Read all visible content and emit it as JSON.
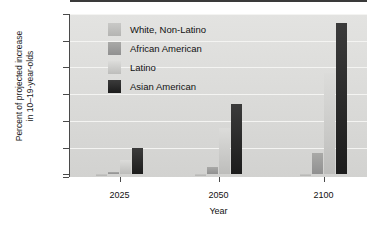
{
  "chart_data": {
    "type": "bar",
    "title": "",
    "xlabel": "Year",
    "ylabel": "Percent of projected increase\nin 10–19-year-olds",
    "categories": [
      "2025",
      "2050",
      "2100"
    ],
    "ylim": [
      -10,
      600
    ],
    "yticks": [
      600,
      500,
      400,
      300,
      200,
      100,
      0,
      -10
    ],
    "grid": true,
    "legend_position": "top-center",
    "series": [
      {
        "name": "White, Non-Latino",
        "color": "#c0c0be",
        "values": [
          -8,
          -6,
          -7
        ]
      },
      {
        "name": "African American",
        "color": "#9d9d9b",
        "values": [
          10,
          28,
          78
        ]
      },
      {
        "name": "Latino",
        "color": "#cfcfcd",
        "values": [
          55,
          175,
          378
        ]
      },
      {
        "name": "Asian American",
        "color": "#2a2a2a",
        "values": [
          100,
          265,
          565
        ]
      }
    ]
  },
  "axes": {
    "ylabel_line1": "Percent of projected increase",
    "ylabel_line2": "in 10–19-year-olds",
    "xlabel": "Year"
  }
}
